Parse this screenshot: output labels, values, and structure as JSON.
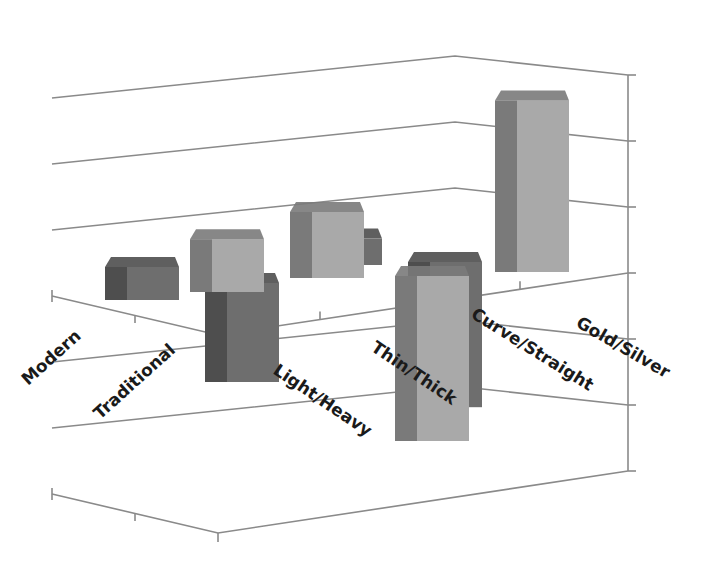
{
  "chart_data": {
    "type": "bar",
    "subtype": "3d-clustered-column",
    "title": "",
    "xlabel": "",
    "ylabel": "",
    "categories": [
      "Modern",
      "Traditional",
      "Light/Heavy",
      "Thin/Thick",
      "Curve/Straight",
      "Gold/Silver"
    ],
    "series": [
      {
        "name": "Front series",
        "color_front": "#a9a9a9",
        "color_side": "#7a7a7a",
        "values": [
          0.0,
          0.8,
          1.0,
          -2.5,
          0.0,
          2.6
        ]
      },
      {
        "name": "Back series",
        "color_front": "#6e6e6e",
        "color_side": "#4e4e4e",
        "values": [
          0.5,
          -1.5,
          0.4,
          -2.2,
          0.0,
          0.0
        ]
      }
    ],
    "ylim": [
      -3,
      3
    ],
    "y_gridlines": [
      -3,
      -2,
      -1,
      0,
      1,
      2,
      3
    ],
    "grid": true,
    "legend": "none",
    "tick_labels_visible": false
  },
  "colors": {
    "background": "#ffffff",
    "gridline": "#8a8a8a",
    "label": "#1a1a1a"
  }
}
